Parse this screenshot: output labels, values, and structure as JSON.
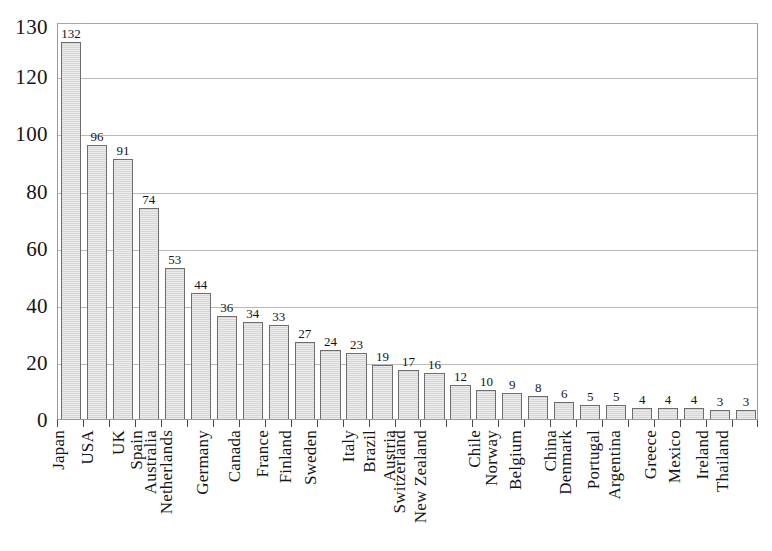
{
  "chart_data": {
    "type": "bar",
    "title": "",
    "subtitle": "",
    "xlabel": "",
    "ylabel": "",
    "ylim": [
      0,
      139
    ],
    "grid": true,
    "grid_axis": "y",
    "legend": false,
    "legend_position": "none",
    "orientation": "vertical",
    "value_labels": true,
    "yticks": [
      0,
      20,
      40,
      60,
      80,
      100,
      120,
      130
    ],
    "ytick_labels": [
      "0",
      "20",
      "40",
      "60",
      "80",
      "100",
      "120",
      "130"
    ],
    "categories": [
      "Japan",
      "USA",
      "UK",
      "Spain",
      "Australia",
      "Netherlands",
      "Germany",
      "Canada",
      "France",
      "Finland",
      "Sweden",
      "Italy",
      "Brazil",
      "Austria",
      "Switzerland",
      "New Zealand",
      "Chile",
      "Norway",
      "Belgium",
      "China",
      "Denmark",
      "Portugal",
      "Argentina",
      "Greece",
      "Mexico",
      "Ireland",
      "Thailand"
    ],
    "values": [
      132,
      96,
      91,
      74,
      53,
      44,
      36,
      34,
      33,
      27,
      24,
      23,
      19,
      17,
      16,
      12,
      10,
      9,
      8,
      6,
      5,
      5,
      4,
      4,
      4,
      3,
      3
    ],
    "value_label_text": [
      "132",
      "96",
      "91",
      "74",
      "53",
      "44",
      "36",
      "34",
      "33",
      "27",
      "24",
      "23",
      "19",
      "17",
      "16",
      "12",
      "10",
      "9",
      "8",
      "6",
      "5",
      "5",
      "4",
      "4",
      "4",
      "3",
      "3"
    ],
    "colors": {
      "bar_fill": "#d6d6d6",
      "bar_border": "#6d6d6d",
      "gridline": "#b9b9b9",
      "frame": "#9a9a9a",
      "text": "#151515",
      "background": "#ffffff"
    }
  }
}
